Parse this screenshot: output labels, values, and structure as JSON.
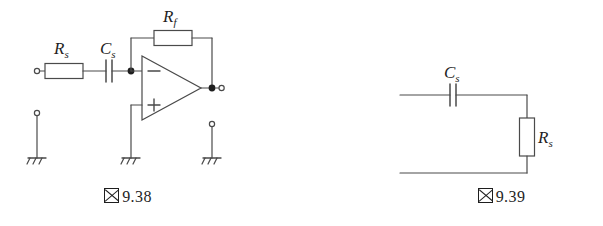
{
  "page": {
    "background_color": "#ffffff",
    "line_color": "#4a4a4a",
    "ink_color": "#1e1e1e",
    "width": 603,
    "height": 226
  },
  "figures": [
    {
      "id": "fig-9-38",
      "caption_kanji": "図",
      "caption_number": "9.38",
      "caption_full": "図 9.38",
      "title": "Inverting operational amplifier with series RC input and feedback resistor",
      "components": [
        {
          "name": "input-terminal",
          "type": "terminal",
          "label": ""
        },
        {
          "name": "series-resistor",
          "type": "resistor",
          "label": "R",
          "subscript": "s",
          "orientation": "horizontal"
        },
        {
          "name": "series-capacitor",
          "type": "capacitor",
          "label": "C",
          "subscript": "s",
          "orientation": "horizontal"
        },
        {
          "name": "feedback-resistor",
          "type": "resistor",
          "label": "R",
          "subscript": "f",
          "orientation": "horizontal"
        },
        {
          "name": "operational-amplifier",
          "type": "op-amp",
          "inverting_label": "−",
          "noninverting_label": "+"
        },
        {
          "name": "output-terminal",
          "type": "terminal",
          "label": ""
        },
        {
          "name": "input-reference-terminal",
          "type": "terminal",
          "label": ""
        },
        {
          "name": "output-reference-terminal",
          "type": "terminal",
          "label": ""
        },
        {
          "name": "ground-input",
          "type": "ground",
          "label": ""
        },
        {
          "name": "ground-noninverting",
          "type": "ground",
          "label": ""
        },
        {
          "name": "ground-output",
          "type": "ground",
          "label": ""
        }
      ]
    },
    {
      "id": "fig-9-39",
      "caption_kanji": "図",
      "caption_number": "9.39",
      "caption_full": "図 9.39",
      "title": "Series capacitor with shunt resistor two-port network",
      "components": [
        {
          "name": "series-capacitor",
          "type": "capacitor",
          "label": "C",
          "subscript": "s",
          "orientation": "horizontal"
        },
        {
          "name": "shunt-resistor",
          "type": "resistor",
          "label": "R",
          "subscript": "s",
          "orientation": "vertical"
        }
      ]
    }
  ],
  "labels": {
    "left_series_resistor": "R",
    "left_series_resistor_sub": "s",
    "left_series_capacitor": "C",
    "left_series_capacitor_sub": "s",
    "left_feedback_resistor": "R",
    "left_feedback_resistor_sub": "f",
    "opamp_inverting": "−",
    "opamp_noninverting": "+",
    "right_series_capacitor": "C",
    "right_series_capacitor_sub": "s",
    "right_shunt_resistor": "R",
    "right_shunt_resistor_sub": "s"
  },
  "captions": {
    "left_kanji": "図",
    "left_number": "9.38",
    "right_kanji": "図",
    "right_number": "9.39"
  }
}
